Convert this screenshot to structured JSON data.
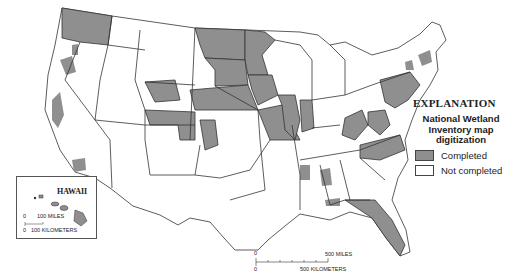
{
  "map": {
    "subject": "Conterminous United States and Hawaii",
    "colors": {
      "completed": "#8f8f8f",
      "not_completed": "#ffffff",
      "border": "#333333"
    }
  },
  "legend": {
    "title": "EXPLANATION",
    "subtitle_lines": [
      "National Wetland",
      "Inventory map",
      "digitization"
    ],
    "items": [
      {
        "label": "Completed",
        "color": "#8f8f8f"
      },
      {
        "label": "Not completed",
        "color": "#ffffff"
      }
    ]
  },
  "hawaii_inset": {
    "title": "HAWAII",
    "scale_zero_miles": "0",
    "scale_miles": "100 MILES",
    "scale_zero_km": "0",
    "scale_km": "100 KILOMETERS"
  },
  "scale_bar": {
    "zero_miles": "0",
    "miles": "500 MILES",
    "zero_km": "0",
    "km": "500 KILOMETERS"
  }
}
